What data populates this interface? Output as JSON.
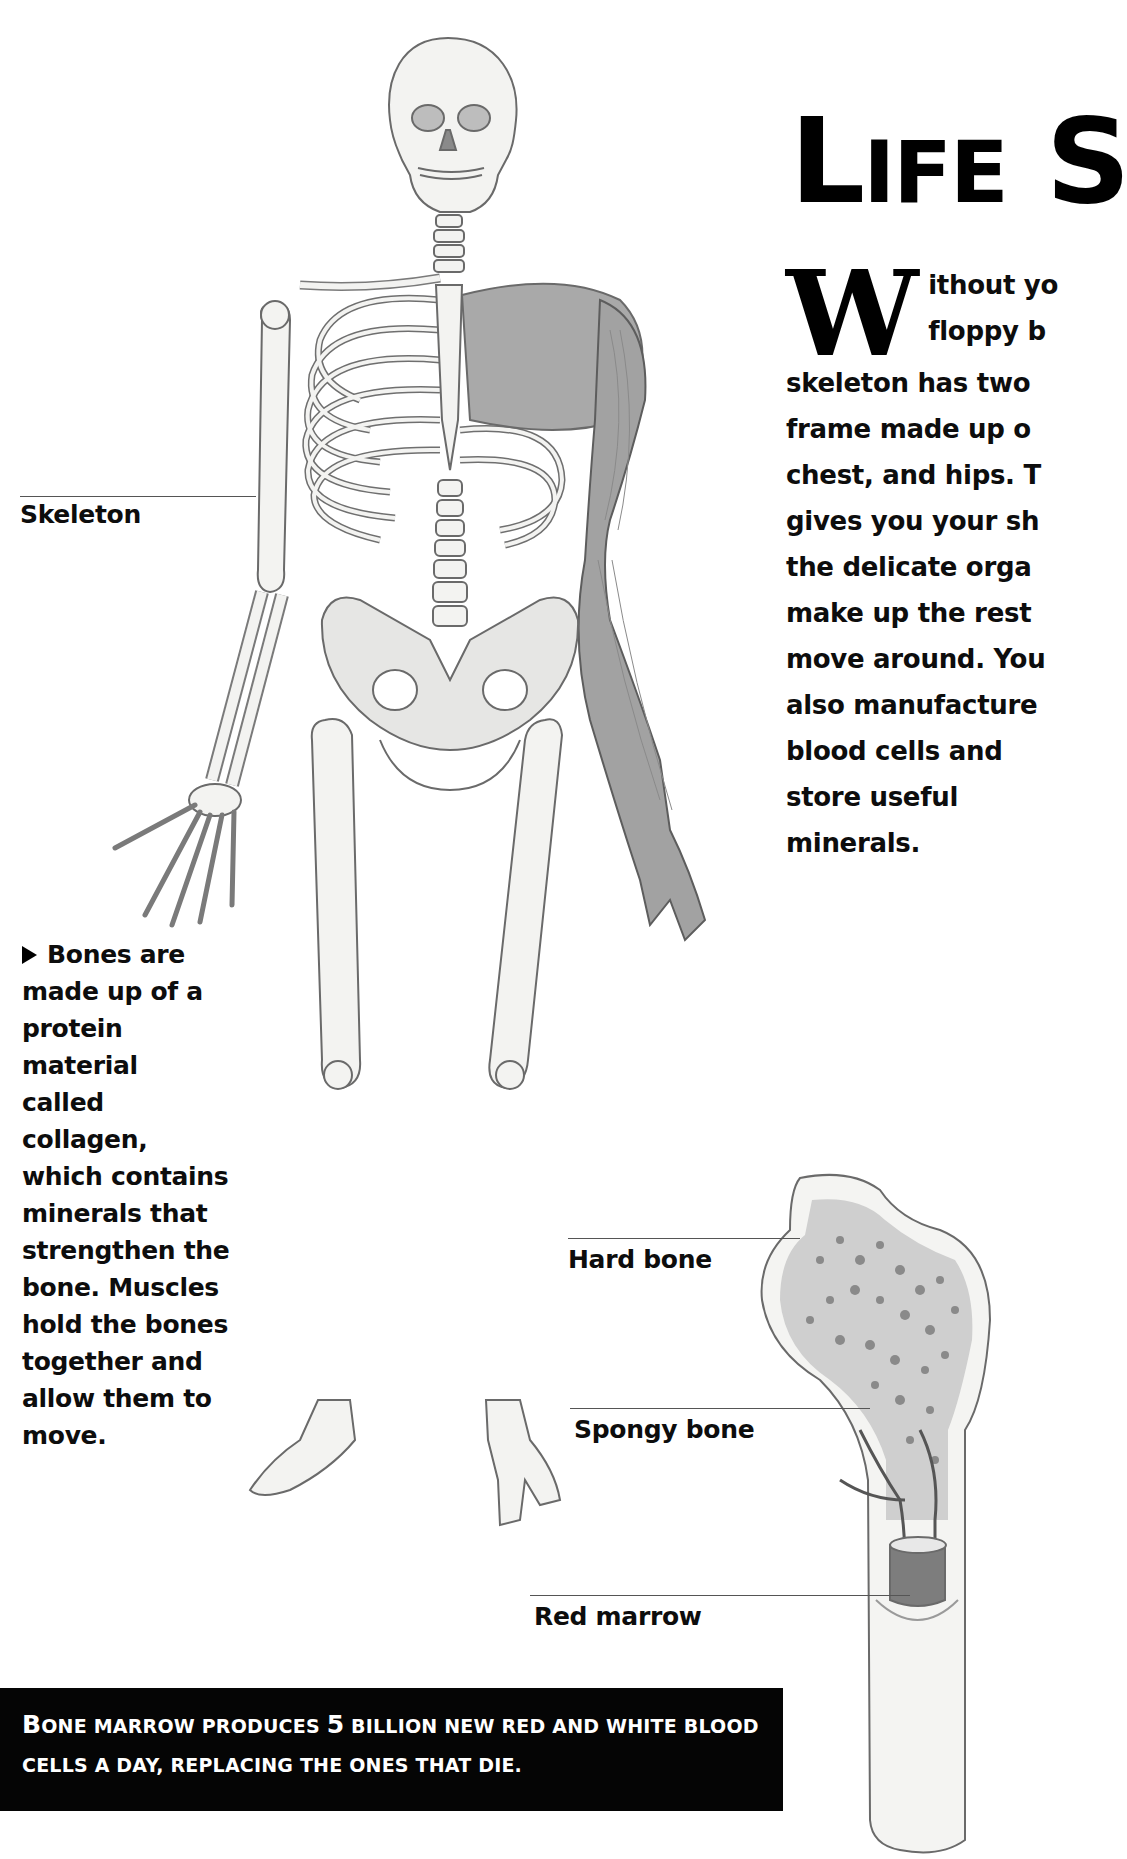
{
  "page": {
    "title": {
      "first_letter": "L",
      "rest": "IFE",
      "second_word_first_letter": "S"
    },
    "intro": {
      "drop_cap": "W",
      "lines": [
        "ithout yo",
        "floppy b",
        "skeleton has two",
        "frame made up o",
        "chest, and hips. T",
        "gives you your sh",
        "the delicate orga",
        "make up the rest",
        "move around. You",
        "also manufacture",
        "blood cells and",
        "store useful",
        "minerals."
      ]
    },
    "labels": {
      "skeleton": "Skeleton",
      "hard_bone": "Hard bone",
      "spongy_bone": "Spongy bone",
      "red_marrow": "Red marrow"
    },
    "sidebar": {
      "bullet_icon": "triangle-right-icon",
      "lines": [
        "Bones are",
        "made up of a",
        "protein material",
        "called collagen,",
        "which contains",
        "minerals that",
        "strengthen the",
        "bone. Muscles",
        "hold the bones",
        "together and",
        "allow them to",
        "move."
      ]
    },
    "fact_box": {
      "line1_first": "B",
      "line1_a": "one marrow produces",
      "line1_number": "5",
      "line1_b": "billion new red and white blood",
      "line2": "cells a day, replacing the ones that die."
    },
    "colors": {
      "text": "#0d0d0d",
      "fact_box_bg": "#050505",
      "fact_box_text": "#ffffff",
      "illustration_stroke": "#6a6a6a",
      "illustration_fill": "#f2f2f0",
      "muscle": "#9a9a9a"
    }
  }
}
